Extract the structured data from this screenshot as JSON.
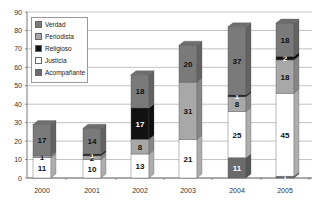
{
  "chart_data": {
    "type": "bar",
    "stacked": true,
    "style": "3d-column",
    "title": "",
    "xlabel": "",
    "ylabel": "",
    "ylim": [
      0,
      90
    ],
    "yticks": [
      0,
      10,
      20,
      30,
      40,
      50,
      60,
      70,
      80,
      90
    ],
    "grid": true,
    "legend_position": "upper-left-inside",
    "categories": [
      "2000",
      "2001",
      "2002",
      "2003",
      "2004",
      "2005"
    ],
    "series": [
      {
        "name": "Acompañante",
        "color": "#6b6b6b",
        "values": [
          0,
          0,
          0,
          0,
          11,
          1
        ]
      },
      {
        "name": "Justicia",
        "color": "#ffffff",
        "values": [
          11,
          10,
          13,
          21,
          25,
          45
        ]
      },
      {
        "name": "Periodista",
        "color": "#a8a8a8",
        "values": [
          1,
          2,
          8,
          31,
          8,
          18
        ]
      },
      {
        "name": "Religioso",
        "color": "#111111",
        "values": [
          0,
          1,
          17,
          0,
          1,
          2
        ]
      },
      {
        "name": "Verdad",
        "color": "#7a7a7a",
        "values": [
          17,
          14,
          18,
          20,
          37,
          18
        ]
      }
    ]
  },
  "legend": {
    "items": [
      {
        "label": "Verdad",
        "color": "#7a7a7a"
      },
      {
        "label": "Periodista",
        "color": "#a8a8a8"
      },
      {
        "label": "Religioso",
        "color": "#111111"
      },
      {
        "label": "Justicia",
        "color": "#ffffff"
      },
      {
        "label": "Acompañante",
        "color": "#6b6b6b"
      }
    ]
  }
}
